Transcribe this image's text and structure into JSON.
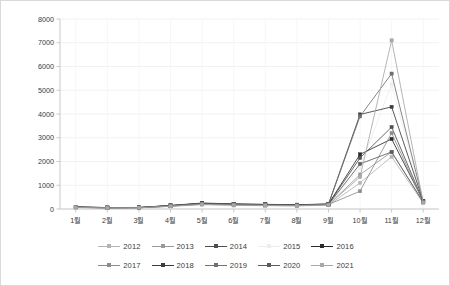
{
  "chart_data": {
    "type": "line",
    "title": "",
    "subtitle": "",
    "xlabel": "",
    "ylabel": "",
    "categories": [
      "1월",
      "2월",
      "3월",
      "4월",
      "5월",
      "6월",
      "7월",
      "8월",
      "9월",
      "10월",
      "11월",
      "12월"
    ],
    "ylim": [
      0,
      8000
    ],
    "yticks": [
      0,
      1000,
      2000,
      3000,
      4000,
      5000,
      6000,
      7000,
      8000
    ],
    "ytick_labels": [
      "0",
      "1000",
      "2000",
      "3000",
      "4000",
      "5000",
      "6000",
      "7000",
      "8000"
    ],
    "grid": true,
    "legend_position": "bottom",
    "markers": "square",
    "series": [
      {
        "name": "2012",
        "color": "#b4b4b4",
        "values": [
          60,
          40,
          45,
          110,
          180,
          150,
          140,
          130,
          160,
          1100,
          2200,
          250
        ]
      },
      {
        "name": "2013",
        "color": "#9a9a9a",
        "values": [
          70,
          45,
          50,
          120,
          200,
          170,
          150,
          140,
          180,
          1450,
          2400,
          280
        ]
      },
      {
        "name": "2014",
        "color": "#4f4f4f",
        "values": [
          80,
          55,
          60,
          140,
          230,
          200,
          180,
          170,
          200,
          2150,
          3450,
          320
        ]
      },
      {
        "name": "2015",
        "color": "#ededed",
        "values": [
          65,
          42,
          48,
          115,
          190,
          160,
          145,
          135,
          170,
          1750,
          5250,
          260
        ]
      },
      {
        "name": "2016",
        "color": "#2b2b2b",
        "values": [
          90,
          60,
          65,
          150,
          250,
          215,
          195,
          180,
          210,
          2300,
          2950,
          340
        ]
      },
      {
        "name": "2017",
        "color": "#8d8d8d",
        "values": [
          75,
          50,
          55,
          130,
          215,
          185,
          165,
          155,
          190,
          750,
          3200,
          300
        ]
      },
      {
        "name": "2018",
        "color": "#3c3c3c",
        "values": [
          85,
          58,
          62,
          145,
          240,
          205,
          190,
          175,
          205,
          3980,
          4300,
          330
        ]
      },
      {
        "name": "2019",
        "color": "#707070",
        "values": [
          78,
          52,
          58,
          135,
          225,
          195,
          175,
          165,
          195,
          3900,
          5700,
          310
        ]
      },
      {
        "name": "2020",
        "color": "#5c5c5c",
        "values": [
          72,
          48,
          52,
          125,
          205,
          178,
          158,
          148,
          185,
          1900,
          2400,
          290
        ]
      },
      {
        "name": "2021",
        "color": "#a8a8a8",
        "values": [
          68,
          44,
          50,
          118,
          195,
          165,
          150,
          138,
          175,
          1350,
          7100,
          270
        ]
      }
    ]
  },
  "legend": {
    "rows": [
      [
        "2012",
        "2013",
        "2014",
        "2015",
        "2016"
      ],
      [
        "2017",
        "2018",
        "2019",
        "2020",
        "2021"
      ]
    ]
  }
}
